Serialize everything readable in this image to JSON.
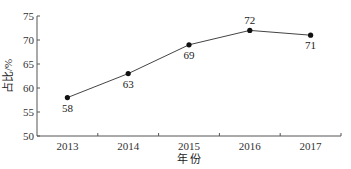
{
  "chart_data": {
    "type": "line",
    "title": "",
    "xlabel": "年 份",
    "ylabel": "占比/%",
    "categories": [
      "2013",
      "2014",
      "2015",
      "2016",
      "2017"
    ],
    "series": [
      {
        "name": "占比",
        "values": [
          58,
          63,
          69,
          72,
          71
        ]
      }
    ],
    "data_labels": [
      "58",
      "63",
      "69",
      "72",
      "71"
    ],
    "yticks": [
      "50",
      "55",
      "60",
      "65",
      "70",
      "75"
    ],
    "ylim": [
      50,
      75
    ],
    "grid": false,
    "legend": "none"
  }
}
